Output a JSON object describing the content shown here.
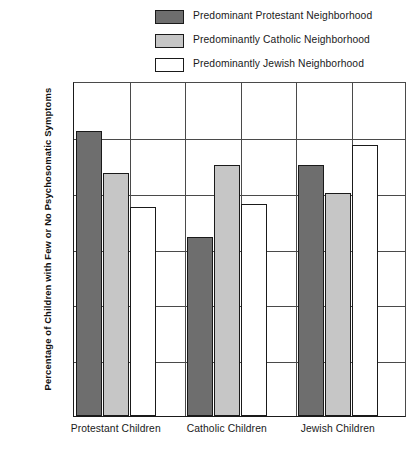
{
  "legend": {
    "items": [
      {
        "label": "Predominant Protestant Neighborhood",
        "color": "#6e6e6e",
        "name": "protestant"
      },
      {
        "label": "Predominantly Catholic Neighborhood",
        "color": "#c6c6c6",
        "name": "catholic"
      },
      {
        "label": "Predominantly Jewish Neighborhood",
        "color": "#ffffff",
        "name": "jewish"
      }
    ]
  },
  "axes": {
    "y_title": "Percentage of Children with Few or No Psychosomatic Symptoms",
    "y_ticks": [
      "60%",
      "50%",
      "40%",
      "30%",
      "20%",
      "10%",
      "0%"
    ],
    "x_labels": [
      "Protestant Children",
      "Catholic Children",
      "Jewish Children"
    ]
  },
  "chart_data": {
    "type": "bar",
    "title": "",
    "subtitle": "",
    "xlabel": "",
    "ylabel": "Percentage of Children with Few or No Psychosomatic Symptoms",
    "categories": [
      "Protestant Children",
      "Catholic Children",
      "Jewish Children"
    ],
    "series": [
      {
        "name": "Predominant Protestant Neighborhood",
        "color": "#6e6e6e",
        "values": [
          51,
          32,
          45
        ]
      },
      {
        "name": "Predominantly Catholic Neighborhood",
        "color": "#c6c6c6",
        "values": [
          43.5,
          45,
          40
        ]
      },
      {
        "name": "Predominantly Jewish Neighborhood",
        "color": "#ffffff",
        "values": [
          37.5,
          38,
          48.5
        ]
      }
    ],
    "ylim": [
      0,
      60
    ],
    "ytick_values": [
      60,
      50,
      40,
      30,
      20,
      10,
      0
    ],
    "yticks_format": "percent",
    "grid": true,
    "grid_axis": "both",
    "legend_position": "top"
  }
}
